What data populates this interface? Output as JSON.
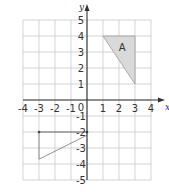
{
  "diagram": {
    "type": "coordinate-grid",
    "x_axis": {
      "label": "x",
      "min": -4,
      "max": 4,
      "ticks": [
        "-4",
        "-3",
        "-2",
        "-1",
        "0",
        "1",
        "2",
        "3",
        "4"
      ]
    },
    "y_axis": {
      "label": "y",
      "min": -5,
      "max": 5,
      "ticks_pos": [
        "1",
        "2",
        "3",
        "4",
        "5"
      ],
      "ticks_neg": [
        "-1",
        "-2",
        "-3",
        "-4",
        "-5"
      ]
    },
    "origin_label": "0",
    "shape_a": {
      "label": "A",
      "vertices": [
        [
          1,
          4
        ],
        [
          3,
          4
        ],
        [
          3,
          1
        ]
      ],
      "fill": "#d9d9d9"
    },
    "partial_shape": {
      "vertices": [
        [
          -3,
          -2
        ],
        [
          0,
          -2
        ],
        [
          0,
          -2.2
        ],
        [
          -3,
          -3.7
        ]
      ],
      "stroke": "#888888"
    },
    "colors": {
      "grid": "#c8c8c8",
      "axis": "#333333"
    }
  }
}
